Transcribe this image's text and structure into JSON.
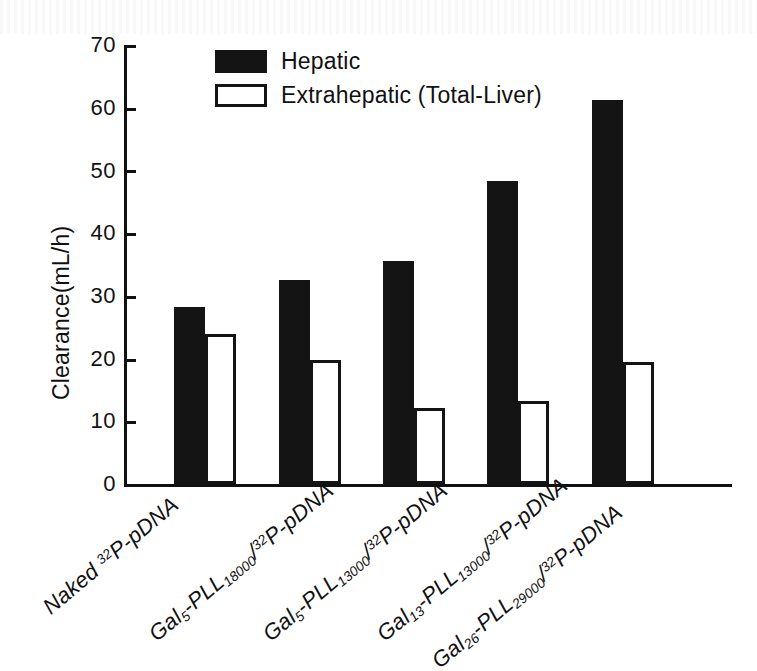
{
  "chart_data": {
    "type": "bar",
    "title": "",
    "xlabel": "",
    "ylabel": "Clearance(mL/h)",
    "ylim": [
      0,
      70
    ],
    "yticks": [
      0,
      10,
      20,
      30,
      40,
      50,
      60,
      70
    ],
    "grid": false,
    "legend_position": "top-center",
    "categories": [
      "Naked 32P-pDNA",
      "Gal5-PLL18000/32P-pDNA",
      "Gal5-PLL13000/32P-pDNA",
      "Gal13-PLL13000/32P-pDNA",
      "Gal26-PLL29000/32P-pDNA"
    ],
    "series": [
      {
        "name": "Hepatic",
        "color": "#141414",
        "values": [
          28.2,
          32.5,
          35.6,
          48.3,
          61.3
        ]
      },
      {
        "name": "Extrahepatic (Total-Liver)",
        "color": "#ffffff",
        "values": [
          23.9,
          19.8,
          12.1,
          13.2,
          19.4
        ]
      }
    ]
  },
  "axis": {
    "y_title": "Clearance(mL/h)",
    "y_tick_labels": [
      "70",
      "60",
      "50",
      "40",
      "30",
      "20",
      "10",
      "0"
    ]
  },
  "legend": {
    "items": [
      {
        "label": "Hepatic",
        "swatch": "filled-square-icon"
      },
      {
        "label": "Extrahepatic (Total-Liver)",
        "swatch": "hollow-square-icon"
      }
    ]
  },
  "x_tick_labels": [
    {
      "parts": [
        {
          "t": "Naked ",
          "style": "normal"
        },
        {
          "t": "32",
          "style": "sup"
        },
        {
          "t": "P-pDNA",
          "style": "normal"
        }
      ]
    },
    {
      "parts": [
        {
          "t": "Gal",
          "style": "normal"
        },
        {
          "t": "5",
          "style": "sub"
        },
        {
          "t": "-PLL",
          "style": "normal"
        },
        {
          "t": "18000",
          "style": "sub"
        },
        {
          "t": "/",
          "style": "normal"
        },
        {
          "t": "32",
          "style": "sup"
        },
        {
          "t": "P-pDNA",
          "style": "normal"
        }
      ]
    },
    {
      "parts": [
        {
          "t": "Gal",
          "style": "normal"
        },
        {
          "t": "5",
          "style": "sub"
        },
        {
          "t": "-PLL",
          "style": "normal"
        },
        {
          "t": "13000",
          "style": "sub"
        },
        {
          "t": "/",
          "style": "normal"
        },
        {
          "t": "32",
          "style": "sup"
        },
        {
          "t": "P-pDNA",
          "style": "normal"
        }
      ]
    },
    {
      "parts": [
        {
          "t": "Gal",
          "style": "normal"
        },
        {
          "t": "13",
          "style": "sub"
        },
        {
          "t": "-PLL",
          "style": "normal"
        },
        {
          "t": "13000",
          "style": "sub"
        },
        {
          "t": "/",
          "style": "normal"
        },
        {
          "t": "32",
          "style": "sup"
        },
        {
          "t": "P-pDNA",
          "style": "normal"
        }
      ]
    },
    {
      "parts": [
        {
          "t": "Gal",
          "style": "normal"
        },
        {
          "t": "26",
          "style": "sub"
        },
        {
          "t": "-PLL",
          "style": "normal"
        },
        {
          "t": "29000",
          "style": "sub"
        },
        {
          "t": "/",
          "style": "normal"
        },
        {
          "t": "32",
          "style": "sup"
        },
        {
          "t": "P-pDNA",
          "style": "normal"
        }
      ]
    }
  ],
  "layout": {
    "plot_left_px": 124,
    "plot_top_px": 45,
    "plot_width_px": 608,
    "plot_height_px": 439,
    "group_centers_px": [
      205,
      310,
      414,
      518,
      623
    ],
    "bar_width_px": 31,
    "xlabel_anchors": [
      {
        "x": 38,
        "y": 600
      },
      {
        "x": 144,
        "y": 627
      },
      {
        "x": 258,
        "y": 627
      },
      {
        "x": 372,
        "y": 627
      },
      {
        "x": 427,
        "y": 654
      }
    ]
  }
}
